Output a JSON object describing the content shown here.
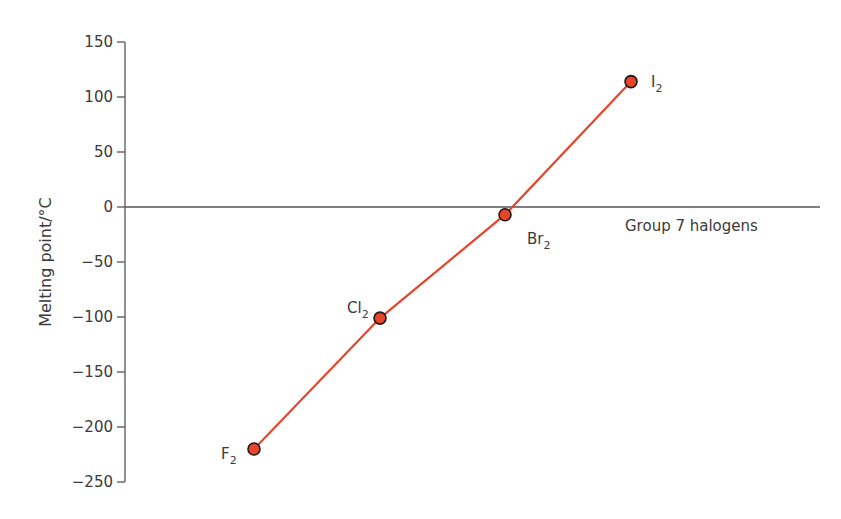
{
  "chart_data": {
    "type": "line",
    "title": "",
    "xlabel": "Group 7 halogens",
    "ylabel": "Melting point/°C",
    "ylim": [
      -250,
      150
    ],
    "yticks": [
      150,
      100,
      50,
      0,
      -50,
      -100,
      -150,
      -200,
      -250
    ],
    "ytick_labels": [
      "150",
      "100",
      "50",
      "0",
      "−50",
      "−100",
      "−150",
      "−200",
      "−250"
    ],
    "grid": false,
    "legend": null,
    "categories": [
      "F2",
      "Cl2",
      "Br2",
      "I2"
    ],
    "series": [
      {
        "name": "Melting point",
        "color": "#e8442a",
        "marker_color": "#e8442a",
        "marker_edge": "#1a1a1a",
        "values": [
          -220,
          -101,
          -7,
          114
        ]
      }
    ],
    "point_labels": [
      {
        "base": "F",
        "sub": "2"
      },
      {
        "base": "Cl",
        "sub": "2"
      },
      {
        "base": "Br",
        "sub": "2"
      },
      {
        "base": "I",
        "sub": "2"
      }
    ]
  },
  "axis": {
    "y_title": "Melting point/°C",
    "x_title": "Group 7 halogens"
  }
}
